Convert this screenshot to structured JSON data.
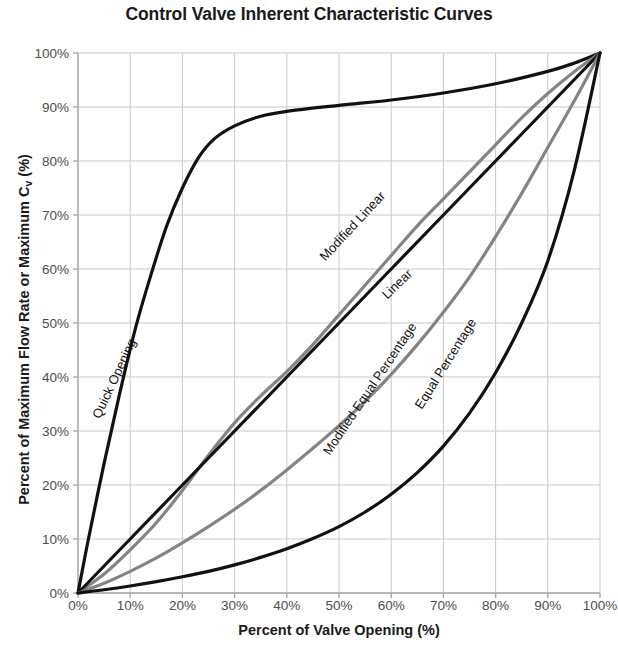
{
  "chart_data": {
    "type": "line",
    "title": "Control Valve Inherent Characteristic Curves",
    "xlabel": "Percent of Valve Opening (%)",
    "ylabel_prefix": "Percent of Maximum Flow Rate or Maximum C",
    "ylabel_sub": "v",
    "ylabel_suffix": " (%)",
    "xlim": [
      0,
      100
    ],
    "ylim": [
      0,
      100
    ],
    "grid": true,
    "legend": "inline-curve-labels",
    "x_ticks": [
      "0%",
      "10%",
      "20%",
      "30%",
      "40%",
      "50%",
      "60%",
      "70%",
      "80%",
      "90%",
      "100%"
    ],
    "y_ticks": [
      "0%",
      "10%",
      "20%",
      "30%",
      "40%",
      "50%",
      "60%",
      "70%",
      "80%",
      "90%",
      "100%"
    ],
    "x_tick_values": [
      0,
      10,
      20,
      30,
      40,
      50,
      60,
      70,
      80,
      90,
      100
    ],
    "y_tick_values": [
      0,
      10,
      20,
      30,
      40,
      50,
      60,
      70,
      80,
      90,
      100
    ],
    "colors": {
      "black_curve": "#111111",
      "gray_curve": "#848484",
      "gridline": "#c9c9c9",
      "axis": "#a8a8a8",
      "tick_text": "#4d4d4d",
      "title_text": "#1a1a1a"
    },
    "series": [
      {
        "name": "Quick Opening",
        "color": "#111111",
        "x": [
          0,
          2,
          5,
          8,
          11,
          14,
          17,
          20,
          23,
          26,
          30,
          35,
          40,
          50,
          60,
          70,
          80,
          90,
          95,
          100
        ],
        "values": [
          0,
          10,
          24,
          37,
          49,
          59,
          68,
          75,
          80.5,
          84,
          86.5,
          88.3,
          89.2,
          90.3,
          91.3,
          92.6,
          94.3,
          96.6,
          98.1,
          100
        ]
      },
      {
        "name": "Modified Linear",
        "color": "#848484",
        "x": [
          0,
          5,
          10,
          15,
          20,
          25,
          30,
          35,
          40,
          45,
          50,
          55,
          60,
          65,
          70,
          75,
          80,
          85,
          90,
          95,
          100
        ],
        "values": [
          0,
          3.5,
          8,
          13,
          19,
          25.5,
          31.5,
          36.5,
          41,
          46,
          51.5,
          57,
          62.5,
          68,
          73,
          78,
          83,
          88,
          92.5,
          96.5,
          100
        ]
      },
      {
        "name": "Linear",
        "color": "#111111",
        "x": [
          0,
          10,
          20,
          30,
          40,
          50,
          60,
          70,
          80,
          90,
          100
        ],
        "values": [
          0,
          10,
          20,
          30,
          40,
          50,
          60,
          70,
          80,
          90,
          100
        ]
      },
      {
        "name": "Modified Equal Percentage",
        "color": "#848484",
        "x": [
          0,
          5,
          10,
          15,
          20,
          25,
          30,
          35,
          40,
          45,
          50,
          55,
          60,
          65,
          70,
          75,
          80,
          85,
          90,
          95,
          100
        ],
        "values": [
          0,
          1.8,
          4,
          6.5,
          9.3,
          12.3,
          15.5,
          19,
          22.8,
          26.8,
          31,
          35.5,
          40.5,
          46,
          52,
          58.5,
          66,
          74,
          82.5,
          91,
          100
        ]
      },
      {
        "name": "Equal Percentage",
        "color": "#111111",
        "x": [
          0,
          5,
          10,
          15,
          20,
          25,
          30,
          35,
          40,
          45,
          50,
          55,
          60,
          65,
          70,
          75,
          80,
          85,
          90,
          95,
          100
        ],
        "values": [
          0,
          0.6,
          1.3,
          2.1,
          3.0,
          4.0,
          5.2,
          6.6,
          8.2,
          10.1,
          12.3,
          15.0,
          18.3,
          22.3,
          27.2,
          33.3,
          40.8,
          50.0,
          61.5,
          78.0,
          100
        ]
      }
    ],
    "annotations": [
      {
        "text": "Quick Opening",
        "x_px": 96,
        "y_px": 410,
        "rotation": -65
      },
      {
        "text": "Modified Linear",
        "x_px": 322,
        "y_px": 251,
        "rotation": -47
      },
      {
        "text": "Linear",
        "x_px": 384,
        "y_px": 289,
        "rotation": -44
      },
      {
        "text": "Modified Equal Percentage",
        "x_px": 326,
        "y_px": 446,
        "rotation": -56
      },
      {
        "text": "Equal Percentage",
        "x_px": 418,
        "y_px": 400,
        "rotation": -58
      }
    ]
  }
}
